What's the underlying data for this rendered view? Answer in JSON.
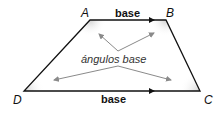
{
  "diagram": {
    "shape": "trapezoid",
    "vertices": {
      "A": {
        "label": "A",
        "x": 90,
        "y": 20
      },
      "B": {
        "label": "B",
        "x": 166,
        "y": 20
      },
      "C": {
        "label": "C",
        "x": 200,
        "y": 91
      },
      "D": {
        "label": "D",
        "x": 24,
        "y": 91
      }
    },
    "top_base_label": "base",
    "bottom_base_label": "base",
    "base_angles_label": "ángulos base",
    "colors": {
      "edge": "#111111",
      "pointer_arrows": "#8a8a8a",
      "angle_shading": "#d8d8d8"
    }
  }
}
